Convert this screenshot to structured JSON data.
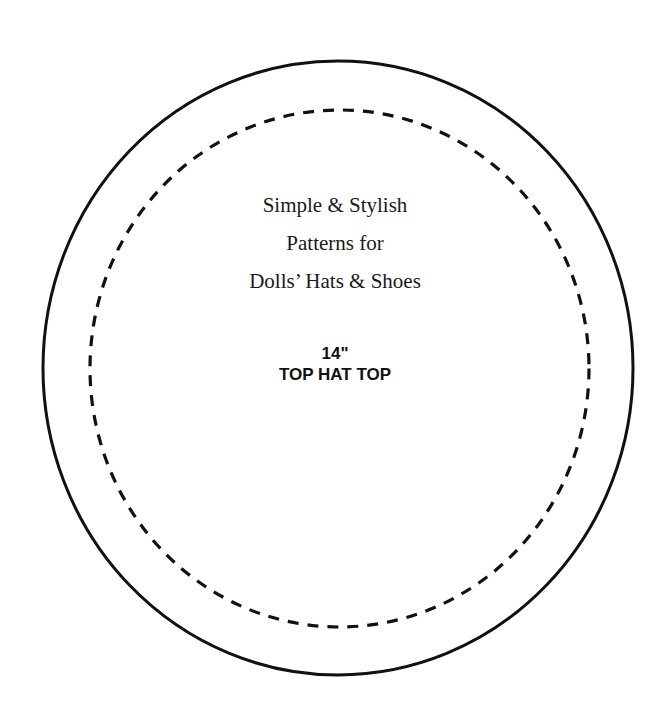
{
  "title": {
    "lines": [
      "Simple & Stylish",
      "Patterns for",
      "Dolls’ Hats & Shoes"
    ]
  },
  "pattern_piece": {
    "size": "14\"",
    "name": "TOP HAT TOP"
  },
  "colors": {
    "line": "#111111",
    "background": "#ffffff"
  },
  "outlines": {
    "cut_line": "solid",
    "stitch_line": "dashed"
  }
}
